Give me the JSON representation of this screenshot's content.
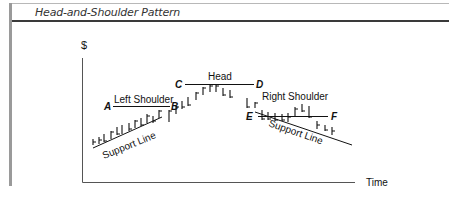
{
  "header": {
    "title": "Head-and-Shoulder Pattern"
  },
  "axes": {
    "y_label": "$",
    "x_label": "Time"
  },
  "points": {
    "A": "A",
    "B": "B",
    "C": "C",
    "D": "D",
    "E": "E",
    "F": "F"
  },
  "labels": {
    "left_shoulder": "Left Shoulder",
    "head": "Head",
    "right_shoulder": "Right Shoulder",
    "support_line_left": "Support Line",
    "support_line_right": "Support Line"
  },
  "colors": {
    "ink": "#111111",
    "frame": "#9a9a9a",
    "rule": "#3a3a3a"
  }
}
